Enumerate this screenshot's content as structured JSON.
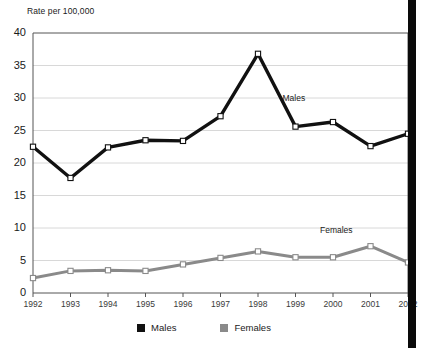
{
  "chart_data": {
    "type": "line",
    "title": "",
    "ylabel": "Rate per 100,000",
    "xlabel": "",
    "ylim": [
      0,
      40
    ],
    "yticks": [
      0,
      5,
      10,
      15,
      20,
      25,
      30,
      35,
      40
    ],
    "grid": true,
    "legend_position": "bottom-center",
    "categories": [
      "1992",
      "1993",
      "1994",
      "1995",
      "1996",
      "1997",
      "1998",
      "1999",
      "2000",
      "2001",
      "2002"
    ],
    "series": [
      {
        "name": "Males",
        "color": "#111111",
        "marker": "square-open",
        "values": [
          22.5,
          17.7,
          22.4,
          23.5,
          23.4,
          27.2,
          36.8,
          25.6,
          26.3,
          22.6,
          24.5
        ]
      },
      {
        "name": "Females",
        "color": "#8a8a8a",
        "marker": "square-open",
        "values": [
          2.3,
          3.4,
          3.5,
          3.4,
          4.4,
          5.4,
          6.4,
          5.5,
          5.5,
          7.2,
          4.7
        ]
      }
    ],
    "annotations": [
      {
        "text": "Males",
        "x_year": "1999",
        "y_value": 29.8
      },
      {
        "text": "Females",
        "x_year": "2000",
        "y_value": 9.6
      }
    ]
  },
  "legend": {
    "items": [
      {
        "label": "Males",
        "color": "#111111"
      },
      {
        "label": "Females",
        "color": "#8a8a8a"
      }
    ]
  },
  "colors": {
    "males": "#111111",
    "females": "#8a8a8a",
    "grid": "#d8d8d8",
    "axis": "#555555",
    "marker_fill": "#ffffff",
    "right_bar": "#0a0a0a"
  }
}
